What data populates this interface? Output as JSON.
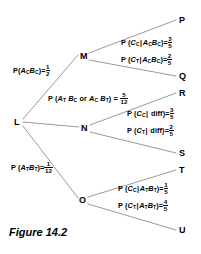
{
  "figure": {
    "caption": "Figure 14.2",
    "line_color": "#9a9a9a",
    "text_color": "#000000",
    "background": "#ffffff"
  },
  "nodes": {
    "root": {
      "label": "L",
      "x": 16,
      "y": 122
    },
    "branch_top": {
      "label": "M",
      "x": 83,
      "y": 57
    },
    "branch_mid": {
      "label": "N",
      "x": 84,
      "y": 129
    },
    "branch_bottom": {
      "label": "O",
      "x": 82,
      "y": 201
    },
    "leaves": [
      {
        "label": "P",
        "x": 182,
        "y": 21
      },
      {
        "label": "Q",
        "x": 182,
        "y": 78
      },
      {
        "label": "R",
        "x": 182,
        "y": 95
      },
      {
        "label": "S",
        "x": 182,
        "y": 155
      },
      {
        "label": "T",
        "x": 182,
        "y": 172
      },
      {
        "label": "U",
        "x": 182,
        "y": 232
      }
    ]
  },
  "branch_labels": {
    "first_stage": [
      {
        "id": "p-ac-bc",
        "prefix": "P",
        "event": "(A_C B_C)",
        "equals": "=",
        "numerator": "1",
        "denominator": "2",
        "text": "P (A_C B_C)=1/2"
      },
      {
        "id": "p-at-bc-or-ac-bt",
        "prefix": "P",
        "event": "(A_T B_C or A_C B_T)",
        "equals": "=",
        "numerator": "5",
        "denominator": "12",
        "text": "P (A_T B_C or A_C B_T) = 5/12"
      },
      {
        "id": "p-at-bt",
        "prefix": "P",
        "event": "(A_T B_T)",
        "equals": "=",
        "numerator": "1",
        "denominator": "12",
        "text": "P (A_T B_T)=1/12"
      }
    ],
    "second_stage": [
      {
        "id": "p-cc-given-ac-bc",
        "prefix": "P",
        "event": "(C_C|A_C B_C)",
        "equals": "=",
        "numerator": "3",
        "denominator": "5",
        "text": "P (C_C|A_C B_C)=3/5"
      },
      {
        "id": "p-ct-given-ac-bc",
        "prefix": "P",
        "event": "(C_T|A_C B_C)",
        "equals": "=",
        "numerator": "2",
        "denominator": "5",
        "text": "P (C_T|A_C B_C)=2/5"
      },
      {
        "id": "p-cc-given-diff",
        "prefix": "P",
        "event": "(C_C| diff)",
        "equals": "=",
        "numerator": "3",
        "denominator": "5",
        "text": "P (C_C| diff)=3/5"
      },
      {
        "id": "p-ct-given-diff",
        "prefix": "P",
        "event": "(C_T| diff)",
        "equals": "=",
        "numerator": "2",
        "denominator": "5",
        "text": "P (C_T| diff)=2/5"
      },
      {
        "id": "p-cc-given-at-bt",
        "prefix": "P",
        "event": "(C_C|A_T B_T)",
        "equals": "=",
        "numerator": "1",
        "denominator": "5",
        "text": "P (C_C|A_T B_T)=1/5"
      },
      {
        "id": "p-ct-given-at-bt",
        "prefix": "P",
        "event": "(C_T|A_T B_T)",
        "equals": "=",
        "numerator": "4",
        "denominator": "5",
        "text": "P (C_T|A_T B_T)=4/5"
      }
    ]
  },
  "symbols": {
    "P": "P",
    "A": "A",
    "B": "B",
    "C": "C",
    "sub_C": "C",
    "sub_T": "T",
    "or": "or",
    "diff": "diff",
    "equals": "=",
    "open_paren": "(",
    "close_paren": ")",
    "cond_bar": "|"
  }
}
